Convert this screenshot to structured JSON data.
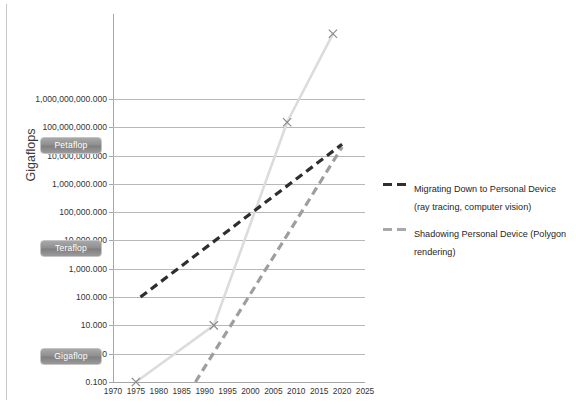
{
  "chart_data": {
    "type": "line",
    "title": "",
    "xlabel": "",
    "ylabel": "Gigaflops",
    "xlim": [
      1970,
      2025
    ],
    "ylim": [
      0.1,
      1000000000000
    ],
    "yscale": "log",
    "xscale": "linear",
    "grid": true,
    "legend_position": "right",
    "x_ticks": [
      "1970",
      "1975",
      "1980",
      "1985",
      "1990",
      "1995",
      "2000",
      "2005",
      "2010",
      "2015",
      "2020",
      "2025"
    ],
    "y_ticks": [
      "1,000,000,000.000",
      "100,000,000.000",
      "10,000,000.000",
      "1,000,000.000",
      "100,000.000",
      "10,000.000",
      "1,000.000",
      "100.000",
      "10.000",
      "1.000",
      "0.100"
    ],
    "y_ticks_full": [
      "1,000,000,000.000",
      "100,000,000.000",
      "10,000,000.000",
      "1,000,000.000",
      "100,000.000",
      "10,000.000",
      "1,000.000",
      "100.000",
      "10.000",
      "1.000",
      "0.100"
    ],
    "y_tick_values": [
      1000000000,
      100000000,
      10000000,
      1000000,
      100000,
      10000,
      1000,
      100,
      10,
      1,
      0.1
    ],
    "y_axis_top_label": "1,000,000,000.000",
    "series": [
      {
        "name": "Migrating Down to Personal Device (ray tracing, computer vision)",
        "style": "dashed",
        "color": "#2e2e2e",
        "x": [
          1976,
          2020
        ],
        "values": [
          100,
          25000000
        ]
      },
      {
        "name": "Shadowing Personal Device (Polygon rendering)",
        "style": "dashed",
        "color": "#9e9e9e",
        "x": [
          1988,
          2020
        ],
        "values": [
          0.1,
          20000000
        ]
      },
      {
        "name": "Supercomputer trend",
        "style": "solid",
        "color": "#dcdcdc",
        "markers": "x",
        "x": [
          1975,
          1992,
          2008,
          2018
        ],
        "values": [
          0.1,
          10,
          150000000,
          200000000000
        ]
      }
    ],
    "markers": [
      {
        "x": 1975,
        "y": 0.1
      },
      {
        "x": 1992,
        "y": 10
      },
      {
        "x": 2008,
        "y": 150000000
      },
      {
        "x": 2018,
        "y": 200000000000
      }
    ],
    "annotations": [
      {
        "label": "Petaflop",
        "y_value": 300000000
      },
      {
        "label": "Teraflop",
        "y_value": 300000
      },
      {
        "label": "Gigaflop",
        "y_value": 0.3
      }
    ]
  },
  "axis": {
    "y_title": "Gigaflops"
  },
  "badges": {
    "petaflop": "Petaflop",
    "teraflop": "Teraflop",
    "gigaflop": "Gigaflop"
  },
  "legend": {
    "items": [
      {
        "label": "Migrating Down to Personal Device (ray tracing, computer vision)",
        "color": "#2e2e2e"
      },
      {
        "label": "Shadowing Personal Device (Polygon rendering)",
        "color": "#a8a8a8"
      }
    ]
  }
}
